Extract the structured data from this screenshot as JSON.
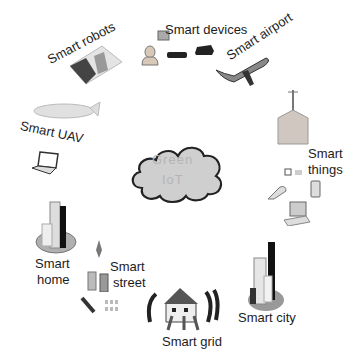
{
  "center": {
    "label_line1": "Green",
    "label_line2": "IoT"
  },
  "nodes": [
    {
      "id": "smart-devices",
      "label": "Smart devices"
    },
    {
      "id": "smart-airport",
      "label": "Smart airport"
    },
    {
      "id": "smart-things",
      "label_line1": "Smart",
      "label_line2": "things"
    },
    {
      "id": "smart-city",
      "label": "Smart city"
    },
    {
      "id": "smart-grid",
      "label": "Smart grid"
    },
    {
      "id": "smart-street",
      "label_line1": "Smart",
      "label_line2": "street"
    },
    {
      "id": "smart-home",
      "label_line1": "Smart",
      "label_line2": "home"
    },
    {
      "id": "smart-uav",
      "label": "Smart UAV"
    },
    {
      "id": "smart-robots",
      "label": "Smart robots"
    }
  ],
  "colors": {
    "cloud_fill": "#cfcfcf",
    "cloud_stroke": "#222222",
    "text": "#1c1c1c"
  }
}
